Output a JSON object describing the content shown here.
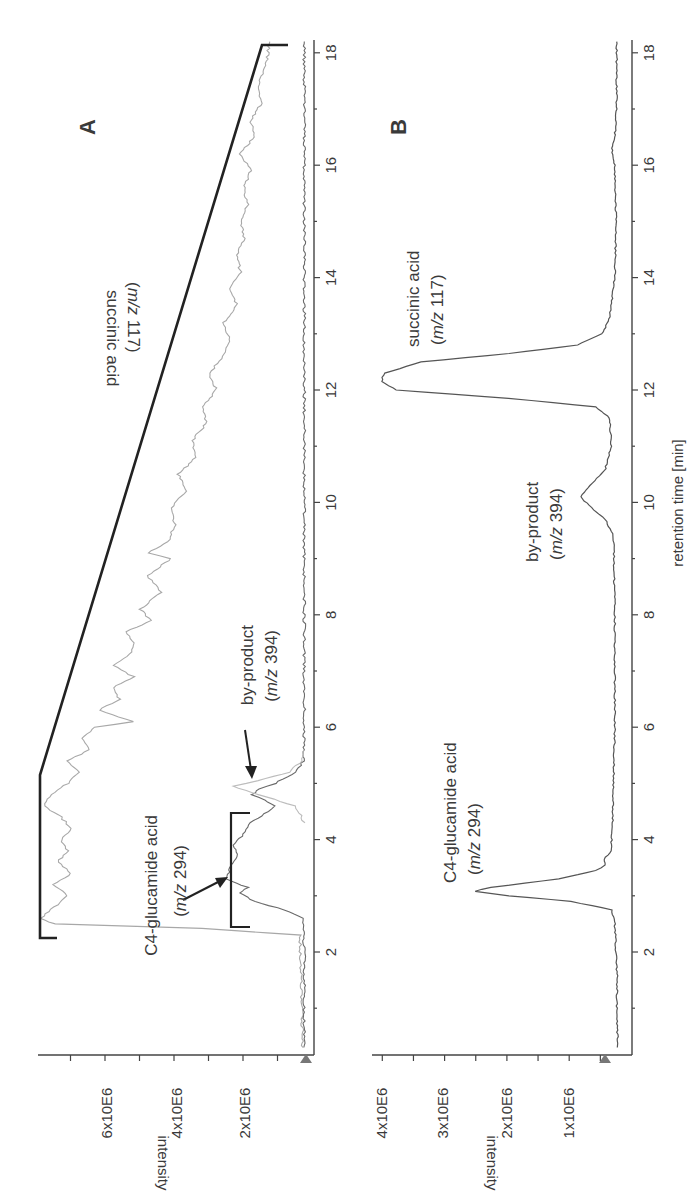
{
  "chart_data": [
    {
      "panel": "A",
      "type": "line",
      "orientation_note": "figure rotated 90 degrees clockwise; retention time runs bottom-to-top, intensity increases right-to-left",
      "xlabel": "retention time [min]",
      "ylabel": "intensity",
      "x_ticks": [
        2,
        4,
        6,
        8,
        10,
        12,
        14,
        16,
        18
      ],
      "y_tick_labels": [
        "2x10E6",
        "4x10E6",
        "6x10E6"
      ],
      "y_ticks": [
        2000000,
        4000000,
        6000000
      ],
      "xlim": [
        0.2,
        18.2
      ],
      "ylim": [
        -200000,
        7800000
      ],
      "gradient_line": {
        "description": "black solvent-gradient trace",
        "points": [
          [
            2.3,
            7.8
          ],
          [
            5.1,
            7.8
          ],
          [
            18.1,
            1.5
          ],
          [
            18.1,
            0.7
          ]
        ]
      },
      "bracket": {
        "from": 2.5,
        "to": 4.5,
        "at_intensity": 2.3
      },
      "annotations": [
        {
          "label": "succinic acid",
          "sub": "(m/z 117)",
          "x": 11,
          "y": 5.5
        },
        {
          "label": "C4-glucamide acid",
          "sub": "(m/z 294)",
          "x": 2.5,
          "y": 3.2,
          "arrow_to": [
            3.3,
            2.4
          ]
        },
        {
          "label": "by-product",
          "sub": "(m/z 394)",
          "x": 6.4,
          "y": 1.8,
          "arrow_to": [
            5.0,
            1.65
          ]
        }
      ],
      "series": [
        {
          "name": "succinic acid (m/z 117)",
          "color": "#a8a8a8",
          "points": [
            [
              0.3,
              0.1
            ],
            [
              1.0,
              0.12
            ],
            [
              1.8,
              0.15
            ],
            [
              2.3,
              0.18
            ],
            [
              2.42,
              3.0
            ],
            [
              2.5,
              7.3
            ],
            [
              2.6,
              7.7
            ],
            [
              2.8,
              7.3
            ],
            [
              3.0,
              6.9
            ],
            [
              3.2,
              7.3
            ],
            [
              3.4,
              6.8
            ],
            [
              3.6,
              7.2
            ],
            [
              3.8,
              6.9
            ],
            [
              4.0,
              7.1
            ],
            [
              4.2,
              6.8
            ],
            [
              4.4,
              7.1
            ],
            [
              4.6,
              7.6
            ],
            [
              4.8,
              7.4
            ],
            [
              5.0,
              6.9
            ],
            [
              5.2,
              6.6
            ],
            [
              5.4,
              6.9
            ],
            [
              5.6,
              6.3
            ],
            [
              5.8,
              6.5
            ],
            [
              6.0,
              6.1
            ],
            [
              6.1,
              5.0
            ],
            [
              6.3,
              6.0
            ],
            [
              6.5,
              5.4
            ],
            [
              6.7,
              5.6
            ],
            [
              6.9,
              5.0
            ],
            [
              7.1,
              5.6
            ],
            [
              7.3,
              5.1
            ],
            [
              7.5,
              5.0
            ],
            [
              7.7,
              5.2
            ],
            [
              7.9,
              4.5
            ],
            [
              8.1,
              4.8
            ],
            [
              8.4,
              4.2
            ],
            [
              8.7,
              4.6
            ],
            [
              9.0,
              3.9
            ],
            [
              9.1,
              4.6
            ],
            [
              9.3,
              4.0
            ],
            [
              9.6,
              3.8
            ],
            [
              9.9,
              3.9
            ],
            [
              10.2,
              3.5
            ],
            [
              10.5,
              3.7
            ],
            [
              10.8,
              3.2
            ],
            [
              11.1,
              3.3
            ],
            [
              11.4,
              2.9
            ],
            [
              11.7,
              3.0
            ],
            [
              12.0,
              2.6
            ],
            [
              12.3,
              2.8
            ],
            [
              12.6,
              2.4
            ],
            [
              12.9,
              2.2
            ],
            [
              13.2,
              2.4
            ],
            [
              13.5,
              2.0
            ],
            [
              13.8,
              2.2
            ],
            [
              14.1,
              1.9
            ],
            [
              14.4,
              2.0
            ],
            [
              14.7,
              1.8
            ],
            [
              15.0,
              1.9
            ],
            [
              15.3,
              1.7
            ],
            [
              15.6,
              1.8
            ],
            [
              15.9,
              1.6
            ],
            [
              16.2,
              1.9
            ],
            [
              16.5,
              1.5
            ],
            [
              16.8,
              1.6
            ],
            [
              17.1,
              1.3
            ],
            [
              17.4,
              1.4
            ],
            [
              17.7,
              1.2
            ],
            [
              18.0,
              1.1
            ],
            [
              18.2,
              1.05
            ]
          ]
        },
        {
          "name": "C4-glucamide acid (m/z 294)",
          "color": "#6a6a6a",
          "points": [
            [
              0.3,
              0.05
            ],
            [
              2.0,
              0.05
            ],
            [
              2.6,
              0.08
            ],
            [
              2.75,
              0.6
            ],
            [
              2.9,
              1.5
            ],
            [
              3.05,
              1.9
            ],
            [
              3.15,
              1.7
            ],
            [
              3.3,
              2.3
            ],
            [
              3.5,
              2.2
            ],
            [
              3.7,
              2.0
            ],
            [
              3.9,
              2.1
            ],
            [
              4.1,
              1.8
            ],
            [
              4.3,
              1.6
            ],
            [
              4.5,
              1.1
            ],
            [
              4.6,
              0.9
            ],
            [
              4.7,
              1.2
            ],
            [
              4.8,
              1.55
            ],
            [
              4.9,
              1.4
            ],
            [
              5.0,
              0.9
            ],
            [
              5.2,
              0.3
            ],
            [
              5.4,
              0.08
            ],
            [
              6.0,
              0.05
            ],
            [
              18.2,
              0.05
            ]
          ]
        },
        {
          "name": "by-product (m/z 394)",
          "color": "#bdbdbd",
          "points": [
            [
              4.3,
              0.05
            ],
            [
              4.6,
              0.3
            ],
            [
              4.8,
              1.4
            ],
            [
              4.95,
              2.1
            ],
            [
              5.05,
              1.4
            ],
            [
              5.2,
              0.5
            ],
            [
              5.4,
              0.1
            ],
            [
              5.6,
              0.05
            ]
          ]
        }
      ]
    },
    {
      "panel": "B",
      "type": "line",
      "orientation_note": "figure rotated 90 degrees clockwise; retention time runs bottom-to-top, intensity increases right-to-left",
      "xlabel": "retention time [min]",
      "ylabel": "intensity",
      "x_ticks": [
        2,
        4,
        6,
        8,
        10,
        12,
        14,
        16,
        18
      ],
      "y_tick_labels": [
        "1x10E6",
        "2x10E6",
        "3x10E6",
        "4x10E6"
      ],
      "y_ticks": [
        1000000,
        2000000,
        3000000,
        4000000
      ],
      "xlim": [
        0.2,
        18.2
      ],
      "ylim": [
        0,
        4100000
      ],
      "annotations": [
        {
          "label": "C4-glucamide acid",
          "sub": "(m/z 294)",
          "x": 3.4,
          "y": 3.3
        },
        {
          "label": "by-product",
          "sub": "(m/z 394)",
          "x": 9.2,
          "y": 1.3
        },
        {
          "label": "succinic acid",
          "sub": "(m/z 117)",
          "x": 13.3,
          "y": 4.1
        }
      ],
      "series": [
        {
          "name": "total ion trace",
          "color": "#555555",
          "points": [
            [
              0.3,
              0.25
            ],
            [
              1.0,
              0.27
            ],
            [
              1.5,
              0.26
            ],
            [
              2.0,
              0.28
            ],
            [
              2.5,
              0.3
            ],
            [
              2.75,
              0.35
            ],
            [
              2.9,
              1.0
            ],
            [
              3.0,
              2.0
            ],
            [
              3.08,
              2.55
            ],
            [
              3.15,
              2.3
            ],
            [
              3.3,
              1.2
            ],
            [
              3.45,
              0.6
            ],
            [
              3.55,
              0.45
            ],
            [
              3.65,
              0.48
            ],
            [
              3.8,
              0.36
            ],
            [
              4.5,
              0.33
            ],
            [
              6.0,
              0.3
            ],
            [
              8.0,
              0.3
            ],
            [
              9.4,
              0.32
            ],
            [
              9.7,
              0.45
            ],
            [
              9.95,
              0.72
            ],
            [
              10.1,
              0.85
            ],
            [
              10.3,
              0.7
            ],
            [
              10.6,
              0.45
            ],
            [
              11.0,
              0.36
            ],
            [
              11.5,
              0.38
            ],
            [
              11.7,
              0.6
            ],
            [
              11.85,
              2.0
            ],
            [
              12.0,
              3.8
            ],
            [
              12.15,
              4.05
            ],
            [
              12.3,
              4.0
            ],
            [
              12.5,
              3.4
            ],
            [
              12.65,
              2.0
            ],
            [
              12.8,
              0.9
            ],
            [
              13.0,
              0.5
            ],
            [
              13.3,
              0.38
            ],
            [
              14.0,
              0.3
            ],
            [
              15.0,
              0.28
            ],
            [
              16.0,
              0.3
            ],
            [
              16.3,
              0.35
            ],
            [
              16.5,
              0.3
            ],
            [
              17.0,
              0.27
            ],
            [
              18.2,
              0.27
            ]
          ]
        }
      ]
    }
  ],
  "panels": {
    "A": {
      "label": "A",
      "ylabel": "intensity",
      "ytick_labels": [
        "6x10E6",
        "4x10E6",
        "2x10E6"
      ],
      "xtick_labels": [
        "2",
        "4",
        "6",
        "8",
        "10",
        "12",
        "14",
        "16",
        "18"
      ],
      "ann_succinic_1": "succinic acid",
      "ann_succinic_2": "(m/z 117)",
      "ann_c4_1": "C4-glucamide acid",
      "ann_c4_2": "(m/z 294)",
      "ann_by_1": "by-product",
      "ann_by_2": "(m/z 394)"
    },
    "B": {
      "label": "B",
      "ylabel": "intensity",
      "xlabel": "retention time [min]",
      "ytick_labels": [
        "4x10E6",
        "3x10E6",
        "2x10E6",
        "1x10E6"
      ],
      "xtick_labels": [
        "2",
        "4",
        "6",
        "8",
        "10",
        "12",
        "14",
        "16",
        "18"
      ],
      "ann_succinic_1": "succinic acid",
      "ann_succinic_2": "(m/z 117)",
      "ann_c4_1": "C4-glucamide acid",
      "ann_c4_2": "(m/z 294)",
      "ann_by_1": "by-product",
      "ann_by_2": "(m/z 394)"
    }
  }
}
